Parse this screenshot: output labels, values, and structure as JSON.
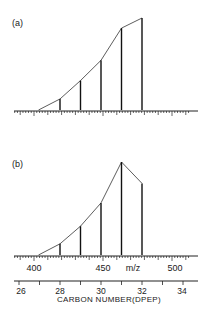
{
  "chart_data": [
    {
      "panel": "(a)",
      "type": "bar",
      "title": "",
      "xlabel": "m/z",
      "ylabel": "",
      "categories": [
        28,
        29,
        30,
        31,
        32
      ],
      "mz_values": [
        420,
        434,
        448,
        462,
        476
      ],
      "values": [
        12,
        32,
        54,
        89,
        100
      ],
      "envelope": "line connecting bar tops, starting from baseline near carbon number 27",
      "grid": false
    },
    {
      "panel": "(b)",
      "type": "bar",
      "title": "",
      "xlabel": "m/z",
      "ylabel": "",
      "categories": [
        28,
        29,
        30,
        31,
        32
      ],
      "mz_values": [
        420,
        434,
        448,
        462,
        476
      ],
      "values": [
        12,
        31,
        56,
        100,
        77
      ],
      "envelope": "line connecting bar tops, starting from baseline near carbon number 27",
      "grid": false
    }
  ],
  "panels": {
    "a": {
      "label": "(a)"
    },
    "b": {
      "label": "(b)"
    }
  },
  "mz_axis": {
    "ticks": [
      "400",
      "450",
      "500"
    ],
    "unit_label": "m/z",
    "xlim": [
      395,
      510
    ]
  },
  "carbon_axis": {
    "ticks": [
      "26",
      "28",
      "30",
      "32",
      "34"
    ],
    "title": "CARBON NUMBER(DPEP)"
  }
}
